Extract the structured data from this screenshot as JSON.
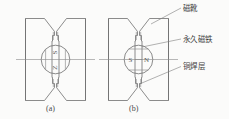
{
  "figure": {
    "title": "",
    "background_color": "#fbfbfa",
    "line_color": "#6f6f6f",
    "text_color": "#3d3d3d"
  },
  "diagrams": [
    {
      "id": "a",
      "caption": "(a)",
      "pole_labels": [
        "S",
        "Z"
      ],
      "orientation": "vertical",
      "separator": "none"
    },
    {
      "id": "b",
      "caption": "(b)",
      "pole_labels": [
        "S",
        "N"
      ],
      "dash": "—",
      "orientation": "horizontal",
      "separator": "chord-lines"
    }
  ],
  "callouts": [
    {
      "key": "pole_shoe",
      "label": "磁靴"
    },
    {
      "key": "permanent_magnet",
      "label": "永久磁铁"
    },
    {
      "key": "copper_braze_layer",
      "label": "铜焊层"
    }
  ]
}
